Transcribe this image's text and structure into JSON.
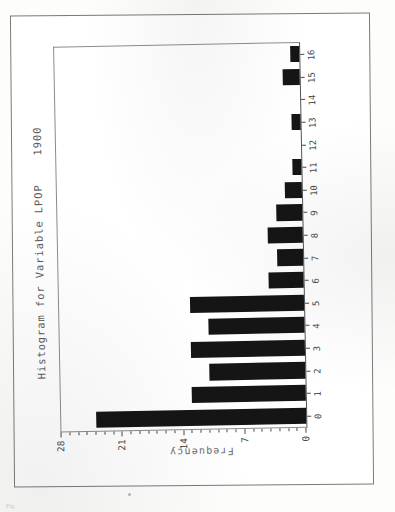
{
  "document": {
    "caption_fragment": "Fig.",
    "background_color": "#fdfdfc"
  },
  "chart_data": {
    "type": "bar",
    "orientation": "rotated-90-ccw",
    "title": "Histogram for Variable LPOP    1900",
    "xlabel": "",
    "ylabel": "Frequency",
    "categories": [
      "0",
      "1",
      "2",
      "3",
      "4",
      "5",
      "6",
      "7",
      "8",
      "9",
      "10",
      "11",
      "12",
      "13",
      "14",
      "15",
      "16"
    ],
    "values": [
      24,
      13,
      11,
      13,
      11,
      13,
      4,
      3,
      4,
      3,
      2,
      1,
      0,
      1,
      0,
      2,
      1
    ],
    "ylim": [
      0,
      28
    ],
    "ytick_labels": [
      "0",
      "7",
      "14",
      "21",
      "28"
    ],
    "ytick_values": [
      0,
      7,
      14,
      21,
      28
    ],
    "yminor_step": 1,
    "grid": "vertical-dashed-at-major-ticks",
    "grid_color": "#9a9a9a",
    "bar_color": "#151515",
    "axis_color": "#4a4a4a",
    "legend": "none"
  }
}
